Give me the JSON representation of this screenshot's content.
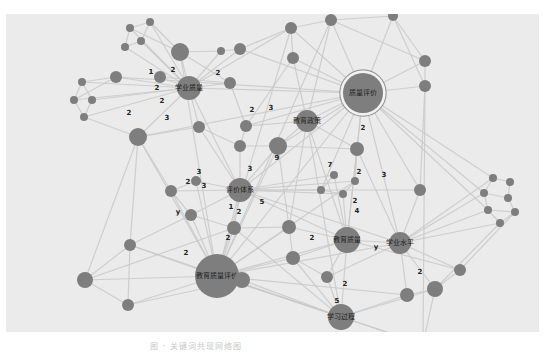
{
  "figure": {
    "background": "#ebebeb",
    "node_color": "#7e7e7e",
    "edge_color": "#c9c9c9",
    "caption": "图 · 关键词共现网络图"
  },
  "nodes": [
    {
      "id": "n_hub_eval",
      "x": 363,
      "y": 93,
      "r": 20,
      "label": "质量评价",
      "ring": true
    },
    {
      "id": "n_edu_quality_eval",
      "x": 217,
      "y": 276,
      "r": 22,
      "label": "教育质量评价"
    },
    {
      "id": "n_learn_quality",
      "x": 189,
      "y": 88,
      "r": 12,
      "label": "学业质量"
    },
    {
      "id": "n_edu_policy",
      "x": 307,
      "y": 121,
      "r": 11,
      "label": "教育政策"
    },
    {
      "id": "n_eval_system",
      "x": 240,
      "y": 190,
      "r": 12,
      "label": "评价体系"
    },
    {
      "id": "n_edu_quality",
      "x": 347,
      "y": 240,
      "r": 13,
      "label": "教育质量"
    },
    {
      "id": "n_learn_level",
      "x": 400,
      "y": 243,
      "r": 11,
      "label": "学业水平"
    },
    {
      "id": "n_learn_process",
      "x": 341,
      "y": 317,
      "r": 13,
      "label": "学习过程"
    },
    {
      "id": "a1",
      "x": 130,
      "y": 28,
      "r": 4
    },
    {
      "id": "a2",
      "x": 150,
      "y": 22,
      "r": 4
    },
    {
      "id": "a3",
      "x": 125,
      "y": 47,
      "r": 4
    },
    {
      "id": "a4",
      "x": 141,
      "y": 41,
      "r": 4
    },
    {
      "id": "a5",
      "x": 180,
      "y": 52,
      "r": 9
    },
    {
      "id": "a6",
      "x": 221,
      "y": 51,
      "r": 4
    },
    {
      "id": "a7",
      "x": 240,
      "y": 49,
      "r": 6
    },
    {
      "id": "a8",
      "x": 160,
      "y": 77,
      "r": 6
    },
    {
      "id": "a9",
      "x": 116,
      "y": 77,
      "r": 6
    },
    {
      "id": "a10",
      "x": 82,
      "y": 82,
      "r": 4
    },
    {
      "id": "a11",
      "x": 74,
      "y": 100,
      "r": 4
    },
    {
      "id": "a12",
      "x": 92,
      "y": 100,
      "r": 4
    },
    {
      "id": "a13",
      "x": 84,
      "y": 117,
      "r": 4
    },
    {
      "id": "a14",
      "x": 138,
      "y": 137,
      "r": 9
    },
    {
      "id": "a15",
      "x": 199,
      "y": 127,
      "r": 6
    },
    {
      "id": "a16",
      "x": 246,
      "y": 126,
      "r": 6
    },
    {
      "id": "a17",
      "x": 240,
      "y": 146,
      "r": 6
    },
    {
      "id": "a18",
      "x": 230,
      "y": 83,
      "r": 6
    },
    {
      "id": "a19",
      "x": 291,
      "y": 28,
      "r": 6
    },
    {
      "id": "a20",
      "x": 331,
      "y": 20,
      "r": 6
    },
    {
      "id": "a21",
      "x": 293,
      "y": 58,
      "r": 6
    },
    {
      "id": "a22",
      "x": 393,
      "y": 16,
      "r": 5
    },
    {
      "id": "a23",
      "x": 425,
      "y": 61,
      "r": 6
    },
    {
      "id": "a24",
      "x": 425,
      "y": 86,
      "r": 6
    },
    {
      "id": "a25",
      "x": 278,
      "y": 146,
      "r": 9
    },
    {
      "id": "a26",
      "x": 357,
      "y": 149,
      "r": 7
    },
    {
      "id": "a27",
      "x": 334,
      "y": 175,
      "r": 4
    },
    {
      "id": "a28",
      "x": 321,
      "y": 190,
      "r": 4
    },
    {
      "id": "a29",
      "x": 355,
      "y": 181,
      "r": 4
    },
    {
      "id": "a30",
      "x": 343,
      "y": 194,
      "r": 4
    },
    {
      "id": "a31",
      "x": 196,
      "y": 181,
      "r": 5
    },
    {
      "id": "a32",
      "x": 171,
      "y": 191,
      "r": 6
    },
    {
      "id": "a33",
      "x": 191,
      "y": 215,
      "r": 6
    },
    {
      "id": "a34",
      "x": 234,
      "y": 228,
      "r": 7
    },
    {
      "id": "a35",
      "x": 289,
      "y": 227,
      "r": 7
    },
    {
      "id": "a36",
      "x": 293,
      "y": 258,
      "r": 7
    },
    {
      "id": "a37",
      "x": 420,
      "y": 190,
      "r": 6
    },
    {
      "id": "a38",
      "x": 130,
      "y": 245,
      "r": 6
    },
    {
      "id": "a39",
      "x": 85,
      "y": 280,
      "r": 8
    },
    {
      "id": "a40",
      "x": 128,
      "y": 305,
      "r": 6
    },
    {
      "id": "a41",
      "x": 242,
      "y": 280,
      "r": 8
    },
    {
      "id": "a42",
      "x": 327,
      "y": 277,
      "r": 6
    },
    {
      "id": "a43",
      "x": 407,
      "y": 295,
      "r": 7
    },
    {
      "id": "a44",
      "x": 435,
      "y": 289,
      "r": 8
    },
    {
      "id": "a45",
      "x": 460,
      "y": 270,
      "r": 6
    },
    {
      "id": "a46",
      "x": 423,
      "y": 344,
      "r": 6
    },
    {
      "id": "a47",
      "x": 493,
      "y": 178,
      "r": 4
    },
    {
      "id": "a48",
      "x": 510,
      "y": 182,
      "r": 4
    },
    {
      "id": "a49",
      "x": 484,
      "y": 193,
      "r": 4
    },
    {
      "id": "a50",
      "x": 508,
      "y": 198,
      "r": 4
    },
    {
      "id": "a51",
      "x": 488,
      "y": 210,
      "r": 4
    },
    {
      "id": "a52",
      "x": 515,
      "y": 212,
      "r": 4
    },
    {
      "id": "a53",
      "x": 500,
      "y": 223,
      "r": 4
    }
  ],
  "edge_labels": [
    {
      "x": 151,
      "y": 72,
      "text": "1"
    },
    {
      "x": 173,
      "y": 70,
      "text": "2"
    },
    {
      "x": 157,
      "y": 88,
      "text": "2"
    },
    {
      "x": 162,
      "y": 101,
      "text": "2"
    },
    {
      "x": 129,
      "y": 113,
      "text": "2"
    },
    {
      "x": 167,
      "y": 118,
      "text": "3"
    },
    {
      "x": 218,
      "y": 73,
      "text": "2"
    },
    {
      "x": 252,
      "y": 110,
      "text": "2"
    },
    {
      "x": 271,
      "y": 108,
      "text": "3"
    },
    {
      "x": 363,
      "y": 128,
      "text": "2"
    },
    {
      "x": 250,
      "y": 169,
      "text": "3"
    },
    {
      "x": 330,
      "y": 165,
      "text": "7"
    },
    {
      "x": 359,
      "y": 172,
      "text": "2"
    },
    {
      "x": 384,
      "y": 175,
      "text": "3"
    },
    {
      "x": 277,
      "y": 158,
      "text": "9"
    },
    {
      "x": 188,
      "y": 182,
      "text": "2"
    },
    {
      "x": 204,
      "y": 186,
      "text": "3"
    },
    {
      "x": 199,
      "y": 172,
      "text": "3"
    },
    {
      "x": 178,
      "y": 212,
      "text": "y"
    },
    {
      "x": 231,
      "y": 207,
      "text": "1"
    },
    {
      "x": 239,
      "y": 212,
      "text": "2"
    },
    {
      "x": 262,
      "y": 202,
      "text": "5"
    },
    {
      "x": 355,
      "y": 201,
      "text": "2"
    },
    {
      "x": 357,
      "y": 211,
      "text": "4"
    },
    {
      "x": 312,
      "y": 238,
      "text": "2"
    },
    {
      "x": 376,
      "y": 247,
      "text": "y"
    },
    {
      "x": 420,
      "y": 272,
      "text": "2"
    },
    {
      "x": 345,
      "y": 284,
      "text": "2"
    },
    {
      "x": 337,
      "y": 301,
      "text": "5"
    },
    {
      "x": 186,
      "y": 253,
      "text": "2"
    },
    {
      "x": 228,
      "y": 238,
      "text": "2"
    },
    {
      "x": 211,
      "y": 340,
      "text": "5"
    }
  ],
  "edges": [
    [
      "n_hub_eval",
      "a19"
    ],
    [
      "n_hub_eval",
      "a20"
    ],
    [
      "n_hub_eval",
      "a22"
    ],
    [
      "n_hub_eval",
      "a23"
    ],
    [
      "n_hub_eval",
      "a24"
    ],
    [
      "n_hub_eval",
      "n_edu_policy"
    ],
    [
      "n_hub_eval",
      "a26"
    ],
    [
      "n_hub_eval",
      "a25"
    ],
    [
      "n_hub_eval",
      "n_learn_quality"
    ],
    [
      "n_hub_eval",
      "a47"
    ],
    [
      "n_hub_eval",
      "a49"
    ],
    [
      "n_hub_eval",
      "a51"
    ],
    [
      "n_hub_eval",
      "n_edu_quality"
    ],
    [
      "n_hub_eval",
      "n_learn_level"
    ],
    [
      "n_hub_eval",
      "a7"
    ],
    [
      "n_hub_eval",
      "a21"
    ],
    [
      "n_hub_eval",
      "n_eval_system"
    ],
    [
      "n_hub_eval",
      "a16"
    ],
    [
      "n_hub_eval",
      "a37"
    ],
    [
      "n_hub_eval",
      "n_edu_quality_eval"
    ],
    [
      "n_hub_eval",
      "a14"
    ],
    [
      "n_hub_eval",
      "a9"
    ],
    [
      "n_hub_eval",
      "a28"
    ],
    [
      "n_edu_quality_eval",
      "a38"
    ],
    [
      "n_edu_quality_eval",
      "a39"
    ],
    [
      "n_edu_quality_eval",
      "a40"
    ],
    [
      "n_edu_quality_eval",
      "a41"
    ],
    [
      "n_edu_quality_eval",
      "a34"
    ],
    [
      "n_edu_quality_eval",
      "a33"
    ],
    [
      "n_edu_quality_eval",
      "a32"
    ],
    [
      "n_edu_quality_eval",
      "n_eval_system"
    ],
    [
      "n_edu_quality_eval",
      "a14"
    ],
    [
      "n_edu_quality_eval",
      "n_learn_process"
    ],
    [
      "n_edu_quality_eval",
      "n_edu_quality"
    ],
    [
      "n_edu_quality_eval",
      "a36"
    ],
    [
      "n_edu_quality_eval",
      "a35"
    ],
    [
      "n_edu_quality_eval",
      "a25"
    ],
    [
      "n_edu_quality_eval",
      "a31"
    ],
    [
      "n_edu_quality_eval",
      "a19"
    ],
    [
      "n_edu_quality_eval",
      "a20"
    ],
    [
      "n_edu_quality_eval",
      "a46"
    ],
    [
      "n_edu_quality_eval",
      "a43"
    ],
    [
      "n_edu_quality_eval",
      "n_learn_level"
    ],
    [
      "n_edu_quality_eval",
      "a29"
    ],
    [
      "n_edu_quality_eval",
      "a5"
    ],
    [
      "n_learn_quality",
      "a1"
    ],
    [
      "n_learn_quality",
      "a2"
    ],
    [
      "n_learn_quality",
      "a3"
    ],
    [
      "n_learn_quality",
      "a4"
    ],
    [
      "n_learn_quality",
      "a5"
    ],
    [
      "n_learn_quality",
      "a8"
    ],
    [
      "n_learn_quality",
      "a9"
    ],
    [
      "n_learn_quality",
      "a14"
    ],
    [
      "n_learn_quality",
      "a15"
    ],
    [
      "n_learn_quality",
      "a18"
    ],
    [
      "n_learn_quality",
      "a6"
    ],
    [
      "n_learn_quality",
      "a7"
    ],
    [
      "n_learn_quality",
      "n_eval_system"
    ],
    [
      "n_learn_quality",
      "a19"
    ],
    [
      "n_learn_quality",
      "a10"
    ],
    [
      "n_learn_quality",
      "a11"
    ],
    [
      "n_learn_quality",
      "a12"
    ],
    [
      "n_learn_quality",
      "a13"
    ],
    [
      "a10",
      "a11"
    ],
    [
      "a10",
      "a12"
    ],
    [
      "a11",
      "a13"
    ],
    [
      "a12",
      "a13"
    ],
    [
      "a10",
      "a9"
    ],
    [
      "a11",
      "a9"
    ],
    [
      "a13",
      "a14"
    ],
    [
      "a1",
      "a2"
    ],
    [
      "a1",
      "a3"
    ],
    [
      "a2",
      "a4"
    ],
    [
      "a3",
      "a4"
    ],
    [
      "a1",
      "a5"
    ],
    [
      "a2",
      "a5"
    ],
    [
      "n_eval_system",
      "a31"
    ],
    [
      "n_eval_system",
      "a32"
    ],
    [
      "n_eval_system",
      "a33"
    ],
    [
      "n_eval_system",
      "a34"
    ],
    [
      "n_eval_system",
      "a17"
    ],
    [
      "n_eval_system",
      "a25"
    ],
    [
      "n_eval_system",
      "a27"
    ],
    [
      "n_eval_system",
      "a28"
    ],
    [
      "n_eval_system",
      "a29"
    ],
    [
      "n_eval_system",
      "a30"
    ],
    [
      "n_eval_system",
      "n_edu_quality"
    ],
    [
      "n_eval_system",
      "n_learn_level"
    ],
    [
      "n_eval_system",
      "a37"
    ],
    [
      "n_eval_system",
      "a15"
    ],
    [
      "n_edu_policy",
      "a25"
    ],
    [
      "n_edu_policy",
      "a16"
    ],
    [
      "n_edu_policy",
      "a21"
    ],
    [
      "n_edu_policy",
      "a26"
    ],
    [
      "n_edu_policy",
      "a20"
    ],
    [
      "n_edu_policy",
      "n_edu_quality"
    ],
    [
      "n_edu_policy",
      "n_learn_process"
    ],
    [
      "n_edu_policy",
      "a35"
    ],
    [
      "n_edu_quality",
      "n_learn_level"
    ],
    [
      "n_edu_quality",
      "n_learn_process"
    ],
    [
      "n_edu_quality",
      "a35"
    ],
    [
      "n_edu_quality",
      "a36"
    ],
    [
      "n_edu_quality",
      "a42"
    ],
    [
      "n_edu_quality",
      "a27"
    ],
    [
      "n_edu_quality",
      "a30"
    ],
    [
      "n_edu_quality",
      "a26"
    ],
    [
      "n_edu_quality",
      "a45"
    ],
    [
      "n_learn_level",
      "a37"
    ],
    [
      "n_learn_level",
      "a43"
    ],
    [
      "n_learn_level",
      "a44"
    ],
    [
      "n_learn_level",
      "a45"
    ],
    [
      "n_learn_level",
      "a47"
    ],
    [
      "n_learn_level",
      "a49"
    ],
    [
      "n_learn_level",
      "a51"
    ],
    [
      "n_learn_level",
      "a53"
    ],
    [
      "n_learn_level",
      "a42"
    ],
    [
      "n_learn_level",
      "a26"
    ],
    [
      "n_learn_process",
      "a42"
    ],
    [
      "n_learn_process",
      "a41"
    ],
    [
      "n_learn_process",
      "a36"
    ],
    [
      "n_learn_process",
      "a43"
    ],
    [
      "n_learn_process",
      "a44"
    ],
    [
      "n_learn_process",
      "a46"
    ],
    [
      "n_learn_process",
      "a34"
    ],
    [
      "n_learn_process",
      "a38"
    ],
    [
      "a38",
      "a39"
    ],
    [
      "a38",
      "a40"
    ],
    [
      "a39",
      "a40"
    ],
    [
      "a39",
      "a34"
    ],
    [
      "a40",
      "a41"
    ],
    [
      "a38",
      "a33"
    ],
    [
      "a47",
      "a48"
    ],
    [
      "a47",
      "a49"
    ],
    [
      "a48",
      "a50"
    ],
    [
      "a49",
      "a50"
    ],
    [
      "a49",
      "a51"
    ],
    [
      "a50",
      "a52"
    ],
    [
      "a51",
      "a53"
    ],
    [
      "a52",
      "a53"
    ],
    [
      "a51",
      "a52"
    ],
    [
      "a44",
      "a45"
    ],
    [
      "a44",
      "a53"
    ],
    [
      "a45",
      "a52"
    ],
    [
      "a43",
      "a44"
    ],
    [
      "a46",
      "a44"
    ],
    [
      "a22",
      "a23"
    ],
    [
      "a22",
      "a24"
    ],
    [
      "a23",
      "a24"
    ],
    [
      "a24",
      "a37"
    ],
    [
      "a24",
      "a46"
    ],
    [
      "a19",
      "a20"
    ],
    [
      "a19",
      "a21"
    ],
    [
      "a20",
      "a22"
    ],
    [
      "a6",
      "a7"
    ],
    [
      "a7",
      "a19"
    ],
    [
      "a5",
      "a6"
    ],
    [
      "a5",
      "a18"
    ],
    [
      "a14",
      "a15"
    ],
    [
      "a14",
      "a38"
    ],
    [
      "a14",
      "a39"
    ],
    [
      "a14",
      "a32"
    ],
    [
      "a15",
      "a17"
    ],
    [
      "a16",
      "a17"
    ],
    [
      "a17",
      "a25"
    ],
    [
      "a25",
      "a26"
    ],
    [
      "a25",
      "a35"
    ],
    [
      "a26",
      "a29"
    ],
    [
      "a27",
      "a28"
    ],
    [
      "a28",
      "a30"
    ],
    [
      "a29",
      "a30"
    ],
    [
      "a31",
      "a32"
    ],
    [
      "a32",
      "a33"
    ],
    [
      "a33",
      "a34"
    ],
    [
      "a34",
      "a35"
    ],
    [
      "a35",
      "a36"
    ],
    [
      "a36",
      "a42"
    ],
    [
      "a8",
      "a18"
    ],
    [
      "a18",
      "a16"
    ],
    [
      "a21",
      "a16"
    ],
    [
      "a20",
      "a23"
    ]
  ]
}
